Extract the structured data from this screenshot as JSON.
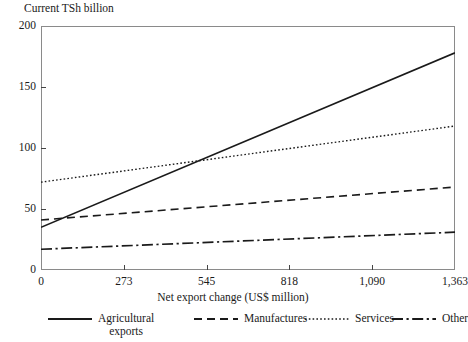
{
  "chart_data": {
    "type": "line",
    "title": "",
    "ylabel": "Current TSh billion",
    "xlabel": "Net export change (US$ million)",
    "xlim": [
      0,
      1363
    ],
    "ylim": [
      0,
      200
    ],
    "grid": false,
    "legend_position": "bottom",
    "x_ticks": [
      0,
      273,
      545,
      818,
      1090,
      1363
    ],
    "x_tick_labels": [
      "0",
      "273",
      "545",
      "818",
      "1,090",
      "1,363"
    ],
    "y_ticks": [
      0,
      50,
      100,
      150,
      200
    ],
    "y_tick_labels": [
      "0",
      "50",
      "100",
      "150",
      "200"
    ],
    "x": [
      0,
      1363
    ],
    "series": [
      {
        "name": "Agricultural exports",
        "style": "solid",
        "values": [
          35,
          178
        ]
      },
      {
        "name": "Manufactures",
        "style": "dashed",
        "values": [
          41,
          68
        ]
      },
      {
        "name": "Services",
        "style": "dotted",
        "values": [
          72,
          118
        ]
      },
      {
        "name": "Other",
        "style": "dashdot",
        "values": [
          17,
          31
        ]
      }
    ],
    "annotations": [
      "Agricultural exports line crosses Services line at approximately x = 545, y = 88"
    ]
  },
  "legend": {
    "items": [
      {
        "label": "Agricultural\nexports",
        "style": "solid"
      },
      {
        "label": "Manufactures",
        "style": "dashed"
      },
      {
        "label": "Services",
        "style": "dotted"
      },
      {
        "label": "Other",
        "style": "dashdot"
      }
    ]
  },
  "colors": {
    "line": "#1a1a1a",
    "frame": "#8a8a8a",
    "background": "#ffffff",
    "text": "#1a1a1a"
  }
}
